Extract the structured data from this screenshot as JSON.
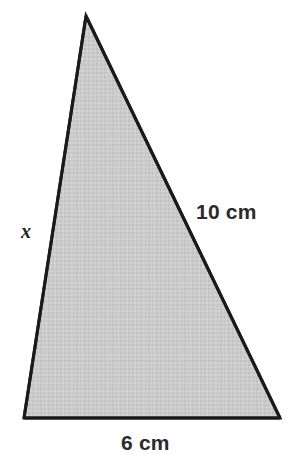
{
  "figure": {
    "kind": "geometry-diagram",
    "shape": "triangle",
    "background_color": "#ffffff",
    "fill_color": "#c8c8c8",
    "stroke_color": "#1a1a1a",
    "stroke_width": 3,
    "vertices": {
      "apex": {
        "x": 86,
        "y": 16
      },
      "bottom_left": {
        "x": 24,
        "y": 418
      },
      "bottom_right": {
        "x": 280,
        "y": 418
      }
    },
    "labels": {
      "left_side": "x",
      "right_side": "10 cm",
      "base": "6 cm"
    }
  },
  "chart_data": {
    "type": "diagram",
    "title": "",
    "shape": "triangle",
    "points": [
      {
        "name": "A",
        "x": 86,
        "y": 16
      },
      {
        "name": "B",
        "x": 24,
        "y": 418
      },
      {
        "name": "C",
        "x": 280,
        "y": 418
      }
    ],
    "edges": [
      {
        "from": "A",
        "to": "B",
        "label": "x",
        "known": false
      },
      {
        "from": "A",
        "to": "C",
        "label": "10 cm",
        "value": 10,
        "unit": "cm",
        "known": true
      },
      {
        "from": "B",
        "to": "C",
        "label": "6 cm",
        "value": 6,
        "unit": "cm",
        "known": true
      }
    ],
    "unknowns": [
      "x"
    ],
    "units": "cm"
  }
}
